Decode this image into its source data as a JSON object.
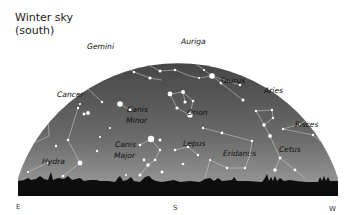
{
  "title": {
    "line1": "Winter sky",
    "line2": "(south)"
  },
  "directions": {
    "east": "E",
    "south": "S",
    "west": "W"
  },
  "colors": {
    "sky_top": "#474747",
    "sky_horizon": "#9c9c9c",
    "ground": "#0d0d0d",
    "stars": "#ffffff",
    "lines": "#d9d9d9",
    "labels": "#111111"
  },
  "constellations": [
    {
      "name": "Gemini",
      "x": 100,
      "y": 47
    },
    {
      "name": "Auriga",
      "x": 180,
      "y": 42
    },
    {
      "name": "Cancer",
      "x": 56,
      "y": 96
    },
    {
      "name": "Taurus",
      "x": 223,
      "y": 81
    },
    {
      "name": "Aries",
      "x": 266,
      "y": 91
    },
    {
      "name": "Canis",
      "x": 128,
      "y": 111
    },
    {
      "name": "Minor",
      "x": 128,
      "y": 122
    },
    {
      "name": "Orion",
      "x": 187,
      "y": 114
    },
    {
      "name": "Pisces",
      "x": 296,
      "y": 126
    },
    {
      "name": "Canis",
      "x": 116,
      "y": 148
    },
    {
      "name": "Major",
      "x": 116,
      "y": 159
    },
    {
      "name": "Lepus",
      "x": 183,
      "y": 145
    },
    {
      "name": "Eridanus",
      "x": 224,
      "y": 155
    },
    {
      "name": "Cetus",
      "x": 281,
      "y": 152
    },
    {
      "name": "Hydra",
      "x": 42,
      "y": 162
    }
  ]
}
